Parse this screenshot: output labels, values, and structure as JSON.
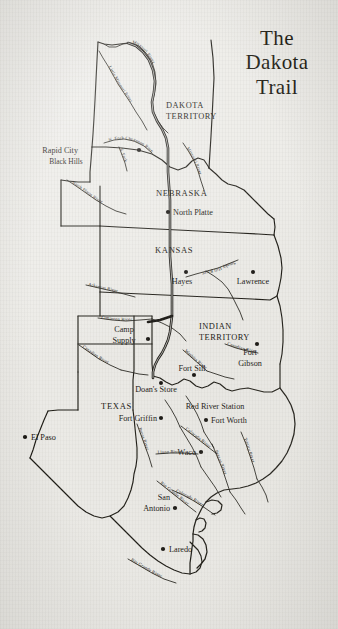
{
  "title": {
    "line1": "The",
    "line2": "Dakota",
    "line3": "Trail"
  },
  "map": {
    "type": "historical-trail-map",
    "regions": [
      {
        "name": "DAKOTA TERRITORY",
        "label_line1": "DAKOTA",
        "label_line2": "TERRITORY"
      },
      {
        "name": "NEBRASKA",
        "label_line1": "NEBRASKA",
        "label_line2": ""
      },
      {
        "name": "KANSAS",
        "label_line1": "KANSAS",
        "label_line2": ""
      },
      {
        "name": "INDIAN TERRITORY",
        "label_line1": "INDIAN",
        "label_line2": "TERRITORY"
      },
      {
        "name": "TEXAS",
        "label_line1": "TEXAS",
        "label_line2": ""
      }
    ],
    "cities": [
      {
        "name": "Rapid City"
      },
      {
        "name": "North Platte"
      },
      {
        "name": "Hayes"
      },
      {
        "name": "Lawrence"
      },
      {
        "name": "Camp Supply",
        "label_line1": "Camp",
        "label_line2": "Supply"
      },
      {
        "name": "Fort Gibson",
        "label_line1": "Fort",
        "label_line2": "Gibson"
      },
      {
        "name": "Fort Sill"
      },
      {
        "name": "Doan's Store"
      },
      {
        "name": "Red River Station"
      },
      {
        "name": "Fort Griffin"
      },
      {
        "name": "Fort Worth"
      },
      {
        "name": "Waco"
      },
      {
        "name": "El Paso"
      },
      {
        "name": "San Antonio",
        "label_line1": "San",
        "label_line2": "Antonio"
      },
      {
        "name": "Laredo"
      }
    ],
    "physical_features": [
      {
        "name": "Black Hills"
      }
    ],
    "rivers": [
      {
        "name": "Missouri River"
      },
      {
        "name": "Little Missouri River"
      },
      {
        "name": "N. Fork Cheyenne River"
      },
      {
        "name": "S. Fork"
      },
      {
        "name": "North Platte River"
      },
      {
        "name": "Smoky Hill River"
      },
      {
        "name": "Arkansas River"
      },
      {
        "name": "Cimarron River"
      },
      {
        "name": "Canadian River"
      },
      {
        "name": "Washita River"
      },
      {
        "name": "Pecos River"
      },
      {
        "name": "Llano River"
      },
      {
        "name": "Colorado River"
      },
      {
        "name": "Rio Grande River"
      },
      {
        "name": "Brazos River"
      },
      {
        "name": "Trinity River"
      }
    ],
    "labels": {
      "dakota_1": "DAKOTA",
      "dakota_2": "TERRITORY",
      "nebraska": "NEBRASKA",
      "kansas": "KANSAS",
      "indian_1": "INDIAN",
      "indian_2": "TERRITORY",
      "texas": "TEXAS",
      "rapid_city": "Rapid City",
      "black_hills": "Black Hills",
      "north_platte": "North Platte",
      "hayes": "Hayes",
      "lawrence": "Lawrence",
      "camp_1": "Camp",
      "camp_2": "Supply",
      "fort_gibson_1": "Fort",
      "fort_gibson_2": "Gibson",
      "fort_sill": "Fort Sill",
      "doans_store": "Doan's Store",
      "red_river_station": "Red River Station",
      "fort_griffin": "Fort Griffin",
      "fort_worth": "Fort Worth",
      "waco": "Waco",
      "el_paso": "El Paso",
      "san_antonio_1": "San",
      "san_antonio_2": "Antonio",
      "laredo": "Laredo",
      "missouri_river": "Missouri River",
      "little_missouri_river": "Little Missouri River",
      "n_fork_cheyenne": "N. Fork Cheyenne River",
      "s_fork": "S. Fork",
      "missouri_river_2": "Missouri River",
      "north_platte_river": "North Platte River",
      "smoky_hill_river": "Smoky Hill River",
      "arkansas_river": "Arkansas River",
      "cimarron_river": "Cimarron River",
      "canadian_river": "Canadian River",
      "canadian_river_2": "Canadian River",
      "washita_river": "Washita River",
      "pecos_river": "Pecos River",
      "llano_river": "Llano River",
      "colorado_river": "Colorado River",
      "colorado_river_2": "Colorado River",
      "rio_grande_river": "Rio Grande River",
      "rio_grande_river_2": "Rio Grande River",
      "brazos_river": "Brazos River",
      "trinity_river": "Trinity River"
    }
  },
  "colors": {
    "paper": "#edece8",
    "ink": "#100e0a"
  }
}
